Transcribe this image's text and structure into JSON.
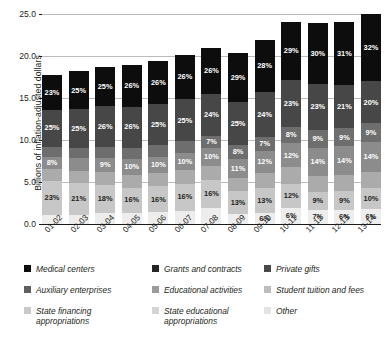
{
  "chart_data": {
    "type": "bar",
    "stacked": true,
    "units": "percent_labels_on_absolute_stacked_bars",
    "title": "",
    "xlabel": "",
    "ylabel": "Billions of inflation-adjusted dollars",
    "ylim": [
      0.0,
      25.0
    ],
    "yticks": [
      "0.0",
      "5.0",
      "10.0",
      "15.0",
      "20.0",
      "25.0"
    ],
    "ytick_values": [
      0.0,
      5.0,
      10.0,
      15.0,
      20.0,
      25.0
    ],
    "grid": true,
    "legend_position": "below",
    "categories": [
      "01-02",
      "02-03",
      "03-04",
      "04-05",
      "05-06",
      "06-07",
      "07-08",
      "08-09",
      "09-10",
      "10-11",
      "11-12",
      "12-13",
      "13-14"
    ],
    "totals": [
      17.7,
      18.2,
      18.7,
      18.9,
      19.6,
      20.1,
      21.0,
      20.4,
      22.4,
      24.1,
      23.9,
      24.3,
      25.0
    ],
    "series": [
      {
        "name": "Medical centers",
        "color": "#0d0d0d",
        "values": [
          23,
          25,
          25,
          26,
          26,
          26,
          26,
          29,
          28,
          29,
          30,
          31,
          32
        ],
        "labels": [
          "23%",
          "25%",
          "25%",
          "26%",
          "26%",
          "26%",
          "26%",
          "29%",
          "28%",
          "29%",
          "30%",
          "31%",
          "32%"
        ]
      },
      {
        "name": "Grants and contracts",
        "color": "#474747",
        "values": [
          25,
          25,
          26,
          26,
          25,
          25,
          24,
          25,
          24,
          23,
          23,
          21,
          20
        ],
        "labels": [
          "25%",
          "25%",
          "26%",
          "26%",
          "25%",
          "25%",
          "24%",
          "25%",
          "24%",
          "23%",
          "23%",
          "21%",
          "20%"
        ]
      },
      {
        "name": "Private gifts",
        "color": "#6e6e6e",
        "values": [
          7,
          7,
          7,
          7,
          7,
          7,
          7,
          8,
          7,
          8,
          9,
          9,
          9
        ],
        "labels": [
          "",
          "",
          "",
          "",
          "",
          "",
          "7%",
          "8%",
          "7%",
          "8%",
          "9%",
          "9%",
          "9%"
        ]
      },
      {
        "name": "Auxiliary enterprises",
        "color": "#8c8c8c",
        "values": [
          8,
          8,
          9,
          10,
          10,
          10,
          10,
          11,
          12,
          12,
          14,
          14,
          14
        ],
        "labels": [
          "8%",
          "",
          "9%",
          "10%",
          "10%",
          "10%",
          "10%",
          "11%",
          "12%",
          "12%",
          "14%",
          "14%",
          "14%"
        ]
      },
      {
        "name": "Educational activities",
        "color": "#ababab",
        "values": [
          8,
          8,
          8,
          8,
          8,
          8,
          8,
          8,
          8,
          8,
          8,
          8,
          8
        ],
        "labels": [
          "",
          "",
          "",
          "",
          "",
          "",
          "",
          "",
          "",
          "",
          "",
          "",
          ""
        ]
      },
      {
        "name": "Student tuition and fees",
        "color": "#c7c7c7",
        "values": [
          23,
          21,
          18,
          16,
          16,
          16,
          16,
          13,
          13,
          12,
          9,
          9,
          10
        ],
        "labels": [
          "23%",
          "21%",
          "18%",
          "16%",
          "16%",
          "16%",
          "16%",
          "13%",
          "13%",
          "12%",
          "9%",
          "9%",
          "10%"
        ]
      },
      {
        "name": "Other",
        "color": "#ededed",
        "values": [
          6,
          6,
          7,
          7,
          7,
          8,
          9,
          6,
          6,
          8,
          7,
          7,
          7
        ],
        "labels": [
          "",
          "",
          "",
          "",
          "",
          "",
          "",
          "",
          "6%",
          "6%",
          "7%",
          "6%",
          "6%"
        ]
      }
    ],
    "legend_entries": [
      {
        "label": "Medical centers",
        "color": "#0d0d0d"
      },
      {
        "label": "Grants and contracts",
        "color": "#252525"
      },
      {
        "label": "Private gifts",
        "color": "#4a4a4a"
      },
      {
        "label": "Auxiliary enterprises",
        "color": "#5f5f5f"
      },
      {
        "label": "Educational activities",
        "color": "#9b9b9b"
      },
      {
        "label": "Student tuition and fees",
        "color": "#bdbdbd"
      },
      {
        "label": "State financing\nappropriations",
        "color": "#c9c9c9"
      },
      {
        "label": "State educational\nappropriations",
        "color": "#d5d5d5"
      },
      {
        "label": "Other",
        "color": "#e3e3e3"
      }
    ]
  }
}
